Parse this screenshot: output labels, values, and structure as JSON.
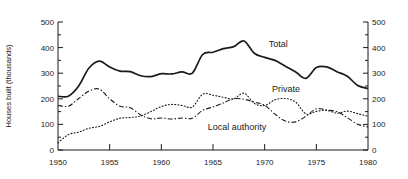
{
  "chart_data": {
    "type": "line",
    "title": "",
    "xlabel": "",
    "ylabel": "Houses built (thousands)",
    "xlim": [
      1950,
      1980
    ],
    "ylim": [
      0,
      500
    ],
    "grid": false,
    "legend_position": "inline-annotations",
    "x_ticks": [
      1950,
      1955,
      1960,
      1965,
      1970,
      1975,
      1980
    ],
    "x_tick_labels": [
      "1950",
      "1955",
      "1960",
      "1965",
      "1970",
      "1975",
      "1980"
    ],
    "y_ticks": [
      0,
      100,
      200,
      300,
      400,
      500
    ],
    "y_tick_labels": [
      "0",
      "100",
      "200",
      "300",
      "400",
      "500"
    ],
    "y_minor_ticks": [
      50,
      150,
      250,
      350,
      450
    ],
    "right_axis": {
      "ylim": [
        0,
        500
      ],
      "y_ticks": [
        0,
        100,
        200,
        300,
        400,
        500
      ],
      "y_tick_labels": [
        "0",
        "100",
        "200",
        "300",
        "400",
        "500"
      ]
    },
    "x": [
      1950,
      1951,
      1952,
      1953,
      1954,
      1955,
      1956,
      1957,
      1958,
      1959,
      1960,
      1961,
      1962,
      1963,
      1964,
      1965,
      1966,
      1967,
      1968,
      1969,
      1970,
      1971,
      1972,
      1973,
      1974,
      1975,
      1976,
      1977,
      1978,
      1979,
      1980
    ],
    "series": [
      {
        "name": "Total",
        "style": "solid",
        "color": "#1a1a1a",
        "label": "Total",
        "values": [
          210,
          210,
          250,
          320,
          347,
          324,
          308,
          306,
          290,
          287,
          298,
          297,
          305,
          300,
          373,
          382,
          396,
          404,
          426,
          378,
          362,
          350,
          327,
          305,
          280,
          322,
          325,
          306,
          288,
          252,
          240
        ]
      },
      {
        "name": "Private",
        "style": "dotted",
        "color": "#1a1a1a",
        "label": "Private",
        "values": [
          28,
          60,
          70,
          85,
          92,
          110,
          124,
          127,
          133,
          150,
          170,
          178,
          174,
          168,
          218,
          214,
          206,
          200,
          222,
          182,
          174,
          196,
          201,
          187,
          141,
          151,
          155,
          144,
          152,
          142,
          132
        ]
      },
      {
        "name": "Local authority",
        "style": "dashdot",
        "color": "#1a1a1a",
        "label": "Local authority",
        "values": [
          175,
          171,
          201,
          230,
          238,
          200,
          171,
          165,
          137,
          122,
          125,
          121,
          125,
          124,
          155,
          168,
          184,
          200,
          198,
          187,
          175,
          140,
          113,
          110,
          132,
          161,
          156,
          150,
          126,
          101,
          90
        ]
      }
    ],
    "annotations": [
      {
        "text": "Total",
        "x": 1970.4,
        "y": 404
      },
      {
        "text": "Private",
        "x": 1970.7,
        "y": 227
      },
      {
        "text": "Local authority",
        "x": 1964.5,
        "y": 78
      }
    ]
  }
}
